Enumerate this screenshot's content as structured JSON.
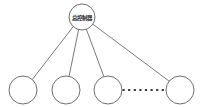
{
  "diagram": {
    "title": "",
    "background_color": "#ffffff",
    "type": "star-topology-tree",
    "root": {
      "label": "总控制器",
      "shape": "circle",
      "center": {
        "x": 82,
        "y": 17
      },
      "radius": 13,
      "stroke_color": "#5f5f5f",
      "fill_color": "#ffffff"
    },
    "leaves": [
      {
        "label": "",
        "center": {
          "x": 23,
          "y": 90
        },
        "radius": 14
      },
      {
        "label": "",
        "center": {
          "x": 66,
          "y": 90
        },
        "radius": 14
      },
      {
        "label": "",
        "center": {
          "x": 108,
          "y": 90
        },
        "radius": 14
      },
      {
        "label": "",
        "center": {
          "x": 180,
          "y": 90
        },
        "radius": 14
      }
    ],
    "edges": [
      {
        "from": "root",
        "to": "leaf-1",
        "style": "solid"
      },
      {
        "from": "root",
        "to": "leaf-2",
        "style": "solid"
      },
      {
        "from": "root",
        "to": "leaf-3",
        "style": "solid"
      },
      {
        "from": "root",
        "to": "leaf-4",
        "style": "solid"
      }
    ],
    "continuation": {
      "from": "leaf-3",
      "to": "leaf-4",
      "style": "dotted",
      "dot_count": 8,
      "color": "#3a3a3a"
    }
  }
}
